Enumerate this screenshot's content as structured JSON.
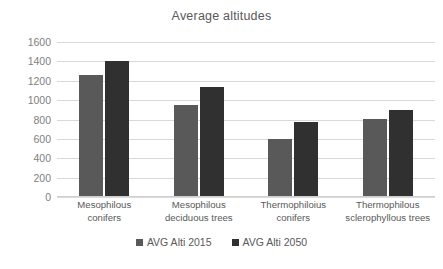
{
  "chart_data": {
    "type": "bar",
    "title": "Average altitudes",
    "xlabel": "",
    "ylabel": "",
    "ylim": [
      0,
      1600
    ],
    "ytick_step": 200,
    "yticks": [
      1600,
      1400,
      1200,
      1000,
      800,
      600,
      400,
      200,
      0
    ],
    "grid": true,
    "legend_position": "bottom",
    "categories": [
      "Mesophilous conifers",
      "Mesophilous deciduous trees",
      "Thermophiloius conifers",
      "Thermophilous sclerophyllous trees"
    ],
    "category_lines": [
      [
        "Mesophilous",
        "conifers"
      ],
      [
        "Mesophilous",
        "deciduous  trees"
      ],
      [
        "Thermophiloius",
        "conifers"
      ],
      [
        "Thermophilous",
        "sclerophyllous  trees"
      ]
    ],
    "series": [
      {
        "name": "AVG Alti 2015",
        "color": "#595959",
        "values": [
          1260,
          950,
          600,
          805
        ]
      },
      {
        "name": "AVG Alti 2050",
        "color": "#303030",
        "values": [
          1405,
          1135,
          775,
          900
        ]
      }
    ]
  },
  "legend": {
    "items": [
      {
        "label": "AVG Alti 2015"
      },
      {
        "label": "AVG Alti 2050"
      }
    ]
  }
}
